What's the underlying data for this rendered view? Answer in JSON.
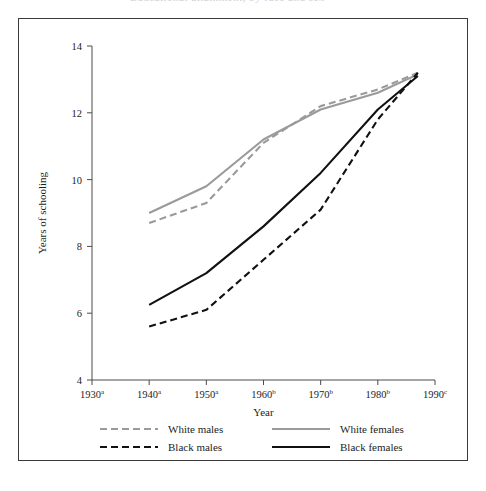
{
  "figure": {
    "background_color": "#ffffff",
    "frame_color": "#3a3a3a",
    "cropped_caption_fragment": "Educational attainment, by race and sex"
  },
  "chart_data": {
    "type": "line",
    "title": "",
    "xlabel": "Year",
    "ylabel": "Years of schooling",
    "xlim": [
      1930,
      1990
    ],
    "ylim": [
      4,
      14
    ],
    "ytick_values": [
      4,
      6,
      8,
      10,
      12,
      14
    ],
    "ytick_labels": [
      "4",
      "6",
      "8",
      "10",
      "12",
      "14"
    ],
    "xtick_values": [
      1930,
      1940,
      1950,
      1960,
      1970,
      1980,
      1990
    ],
    "xtick_labels": [
      "1930",
      "1940",
      "1950",
      "1960",
      "1970",
      "1980",
      "1990"
    ],
    "xtick_superscripts": [
      "a",
      "a",
      "a",
      "b",
      "b",
      "b",
      "c"
    ],
    "grid": false,
    "legend_position": "below-axes",
    "series": [
      {
        "name": "White males",
        "color": "#9a9a9a",
        "style": "dashed",
        "x": [
          1940,
          1950,
          1960,
          1970,
          1980,
          1987
        ],
        "values": [
          8.7,
          9.3,
          11.1,
          12.2,
          12.7,
          13.2
        ]
      },
      {
        "name": "White females",
        "color": "#9a9a9a",
        "style": "solid",
        "x": [
          1940,
          1950,
          1960,
          1970,
          1980,
          1987
        ],
        "values": [
          9.0,
          9.8,
          11.2,
          12.1,
          12.6,
          13.15
        ]
      },
      {
        "name": "Black males",
        "color": "#111111",
        "style": "dashed",
        "x": [
          1940,
          1950,
          1960,
          1970,
          1980,
          1987
        ],
        "values": [
          5.6,
          6.1,
          7.6,
          9.1,
          11.8,
          13.2
        ]
      },
      {
        "name": "Black females",
        "color": "#111111",
        "style": "solid",
        "x": [
          1940,
          1950,
          1960,
          1970,
          1980,
          1987
        ],
        "values": [
          6.25,
          7.2,
          8.6,
          10.2,
          12.1,
          13.1
        ]
      }
    ]
  },
  "legend": {
    "entries": [
      {
        "label": "White males",
        "color": "#9a9a9a",
        "style": "dashed"
      },
      {
        "label": "White females",
        "color": "#9a9a9a",
        "style": "solid"
      },
      {
        "label": "Black males",
        "color": "#111111",
        "style": "dashed"
      },
      {
        "label": "Black females",
        "color": "#111111",
        "style": "solid"
      }
    ]
  }
}
